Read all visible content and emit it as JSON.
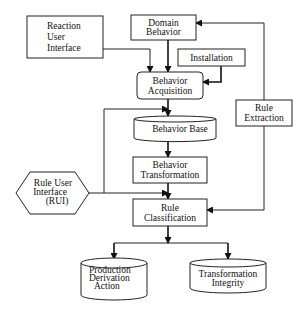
{
  "diagram": {
    "nodes": {
      "reaction_ui": {
        "lines": [
          "Reaction",
          "User",
          "Interface"
        ]
      },
      "domain_behavior": {
        "lines": [
          "Domain",
          "Behavior"
        ]
      },
      "installation": {
        "lines": [
          "Installation"
        ]
      },
      "behavior_acquisition": {
        "lines": [
          "Behavior",
          "Acquisition"
        ]
      },
      "behavior_base": {
        "lines": [
          "Behavior Base"
        ]
      },
      "behavior_transformation": {
        "lines": [
          "Behavior",
          "Transformation"
        ]
      },
      "rule_extraction": {
        "lines": [
          "Rule",
          "Extraction"
        ]
      },
      "rule_user_interface": {
        "lines": [
          "Rule User",
          "Interface",
          "(RUI)"
        ]
      },
      "rule_classification": {
        "lines": [
          "Rule",
          "Classification"
        ]
      },
      "production_derivation_action": {
        "lines": [
          "Production",
          "Derivation",
          "Action"
        ]
      },
      "transformation_integrity": {
        "lines": [
          "Transformation",
          "Integrity"
        ]
      }
    },
    "edges": [
      {
        "from": "Reaction User Interface",
        "to": "Behavior Acquisition"
      },
      {
        "from": "Domain Behavior",
        "to": "Behavior Acquisition"
      },
      {
        "from": "Installation",
        "to": "Behavior Acquisition"
      },
      {
        "from": "Behavior Acquisition",
        "to": "Behavior Base"
      },
      {
        "from": "Behavior Base",
        "to": "Behavior Transformation"
      },
      {
        "from": "Behavior Transformation",
        "to": "Rule Classification"
      },
      {
        "from": "Rule User Interface (RUI)",
        "to": "Behavior Base"
      },
      {
        "from": "Rule User Interface (RUI)",
        "to": "Rule Classification"
      },
      {
        "from": "Rule Extraction",
        "to": "Domain Behavior"
      },
      {
        "from": "Rule Extraction",
        "to": "Rule Classification"
      },
      {
        "from": "Rule Classification",
        "to": "Production Derivation Action"
      },
      {
        "from": "Rule Classification",
        "to": "Transformation Integrity"
      }
    ]
  }
}
